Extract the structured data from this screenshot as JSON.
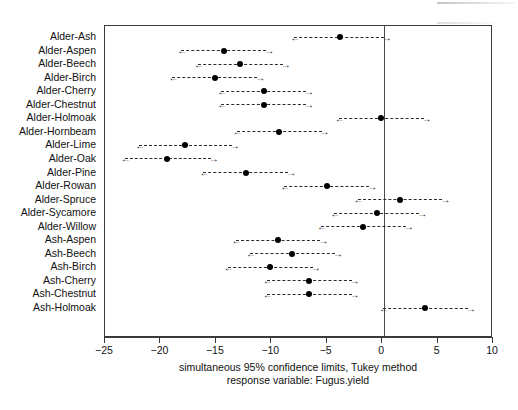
{
  "chart_data": {
    "type": "scatter",
    "title": "",
    "xlabel": "",
    "ylabel": "",
    "xlim": [
      -25,
      10
    ],
    "xticks": [
      -25,
      -20,
      -15,
      -10,
      -5,
      0,
      5,
      10
    ],
    "xticklabels": [
      "−25",
      "−20",
      "−15",
      "−10",
      "−5",
      "0",
      "5",
      "10"
    ],
    "grid": false,
    "legend": null,
    "reference_line_x": 0,
    "caption_line1": "simultaneous  95% confidence limits, Tukey method",
    "caption_line2": "response variable: Fugus.yield",
    "categories": [
      "Alder-Ash",
      "Alder-Aspen",
      "Alder-Beech",
      "Alder-Birch",
      "Alder-Cherry",
      "Alder-Chestnut",
      "Alder-Holmoak",
      "Alder-Hornbeam",
      "Alder-Lime",
      "Alder-Oak",
      "Alder-Pine",
      "Alder-Rowan",
      "Alder-Spruce",
      "Alder-Sycamore",
      "Alder-Willow",
      "Ash-Aspen",
      "Ash-Beech",
      "Ash-Birch",
      "Ash-Cherry",
      "Ash-Chestnut",
      "Ash-Holmoak"
    ],
    "estimates": [
      -3.7,
      -14.2,
      -12.7,
      -15.0,
      -10.6,
      -10.6,
      0.0,
      -9.2,
      -17.7,
      -19.3,
      -12.2,
      -4.9,
      1.7,
      -0.4,
      -1.6,
      -9.3,
      -8.0,
      -10.0,
      -6.5,
      -6.5,
      4.0
    ],
    "lower_limits": [
      -8.1,
      -18.3,
      -16.8,
      -19.1,
      -14.7,
      -14.7,
      -4.1,
      -13.3,
      -22.1,
      -23.4,
      -16.3,
      -9.0,
      -2.4,
      -4.5,
      -5.7,
      -13.4,
      -12.1,
      -14.1,
      -10.6,
      -10.6,
      -0.1
    ],
    "upper_limits": [
      0.5,
      -10.1,
      -8.6,
      -10.9,
      -6.5,
      -6.5,
      4.1,
      -5.1,
      -13.2,
      -15.1,
      -8.1,
      -0.8,
      5.8,
      3.7,
      2.5,
      -5.2,
      -3.9,
      -5.9,
      -2.4,
      -2.4,
      8.1
    ],
    "marker": "filled-circle",
    "interval_style": "dashed-with-arrow-caps"
  },
  "colors": {
    "axis": "#3a3a3a",
    "marker": "#000000",
    "interval": "#2b2b2b",
    "reference_line": "#4a4a4a",
    "background": "#ffffff"
  }
}
